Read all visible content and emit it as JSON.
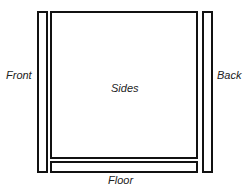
{
  "diagram": {
    "title": "",
    "panels": [
      {
        "id": "front",
        "label": "Front"
      },
      {
        "id": "sides",
        "label": "Sides"
      },
      {
        "id": "floor",
        "label": "Floor"
      },
      {
        "id": "back",
        "label": "Back"
      }
    ]
  },
  "colors": {
    "stroke": "#111111",
    "background": "#ffffff",
    "text": "#222222"
  }
}
